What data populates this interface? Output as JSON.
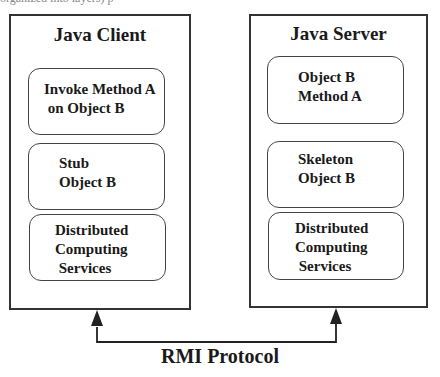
{
  "caption_fragment": "organized into layers) p",
  "client": {
    "title": "Java Client",
    "boxes": [
      {
        "label": "Invoke Method A\n on Object B"
      },
      {
        "label": "Stub\nObject B"
      },
      {
        "label": "Distributed\nComputing\n Services"
      }
    ]
  },
  "server": {
    "title": "Java Server",
    "boxes": [
      {
        "label": "Object B\nMethod A"
      },
      {
        "label": "Skeleton\nObject B"
      },
      {
        "label": "Distributed\nComputing\n Services"
      }
    ]
  },
  "connection": {
    "label": "RMI Protocol",
    "stroke_color": "#222222"
  }
}
